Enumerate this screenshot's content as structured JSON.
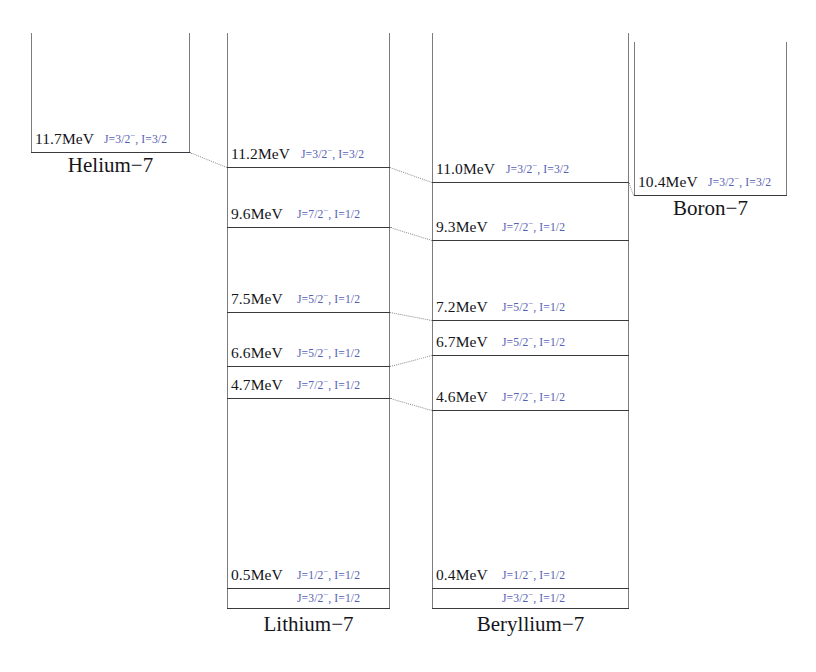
{
  "figure": {
    "type": "nuclear-energy-level-diagram",
    "energy_unit": "MeV"
  },
  "columns": [
    {
      "id": "helium-7",
      "name": "Helium−7",
      "box": {
        "left": 31,
        "right": 190,
        "top": 33,
        "bottom": 152
      },
      "caption_y": 155,
      "levels": [
        {
          "id": "he7-gs",
          "energy": "11.7MeV",
          "qnum": "J=3/2",
          "parity": "−",
          "iso": ", I=3/2",
          "y": 152,
          "label_y": 131,
          "energy_x": 4,
          "qnum_x": 73
        }
      ]
    },
    {
      "id": "lithium-7",
      "name": "Lithium−7",
      "box": {
        "left": 227,
        "right": 390,
        "top": 33,
        "bottom": 608
      },
      "caption_y": 614,
      "levels": [
        {
          "id": "li7-11p2",
          "energy": "11.2MeV",
          "qnum": "J=3/2",
          "parity": "−",
          "iso": ", I=3/2",
          "y": 167,
          "label_y": 146,
          "energy_x": 4,
          "qnum_x": 74
        },
        {
          "id": "li7-9p6",
          "energy": "9.6MeV",
          "qnum": "J=7/2",
          "parity": "−",
          "iso": ", I=1/2",
          "y": 227,
          "label_y": 206,
          "energy_x": 4,
          "qnum_x": 70
        },
        {
          "id": "li7-7p5",
          "energy": "7.5MeV",
          "qnum": "J=5/2",
          "parity": "−",
          "iso": ", I=1/2",
          "y": 312,
          "label_y": 291,
          "energy_x": 4,
          "qnum_x": 70
        },
        {
          "id": "li7-6p6",
          "energy": "6.6MeV",
          "qnum": "J=5/2",
          "parity": "−",
          "iso": ", I=1/2",
          "y": 366,
          "label_y": 345,
          "energy_x": 4,
          "qnum_x": 70
        },
        {
          "id": "li7-4p7",
          "energy": "4.7MeV",
          "qnum": "J=7/2",
          "parity": "−",
          "iso": ", I=1/2",
          "y": 398,
          "label_y": 377,
          "energy_x": 4,
          "qnum_x": 70
        },
        {
          "id": "li7-0p5",
          "energy": "0.5MeV",
          "qnum": "J=1/2",
          "parity": "−",
          "iso": ", I=1/2",
          "y": 588,
          "label_y": 567,
          "energy_x": 4,
          "qnum_x": 70
        },
        {
          "id": "li7-gs",
          "energy": "",
          "qnum": "J=3/2",
          "parity": "−",
          "iso": ", I=1/2",
          "y": 608,
          "label_y": 590,
          "energy_x": 4,
          "qnum_x": 70
        }
      ]
    },
    {
      "id": "beryllium-7",
      "name": "Beryllium−7",
      "box": {
        "left": 432,
        "right": 629,
        "top": 33,
        "bottom": 608
      },
      "caption_y": 614,
      "levels": [
        {
          "id": "be7-11p0",
          "energy": "11.0MeV",
          "qnum": "J=3/2",
          "parity": "−",
          "iso": ", I=3/2",
          "y": 182,
          "label_y": 161,
          "energy_x": 4,
          "qnum_x": 74
        },
        {
          "id": "be7-9p3",
          "energy": "9.3MeV",
          "qnum": "J=7/2",
          "parity": "−",
          "iso": ", I=1/2",
          "y": 240,
          "label_y": 219,
          "energy_x": 4,
          "qnum_x": 70
        },
        {
          "id": "be7-7p2",
          "energy": "7.2MeV",
          "qnum": "J=5/2",
          "parity": "−",
          "iso": ", I=1/2",
          "y": 320,
          "label_y": 299,
          "energy_x": 4,
          "qnum_x": 70
        },
        {
          "id": "be7-6p7",
          "energy": "6.7MeV",
          "qnum": "J=5/2",
          "parity": "−",
          "iso": ", I=1/2",
          "y": 355,
          "label_y": 334,
          "energy_x": 4,
          "qnum_x": 70
        },
        {
          "id": "be7-4p6",
          "energy": "4.6MeV",
          "qnum": "J=7/2",
          "parity": "−",
          "iso": ", I=1/2",
          "y": 410,
          "label_y": 389,
          "energy_x": 4,
          "qnum_x": 70
        },
        {
          "id": "be7-0p4",
          "energy": "0.4MeV",
          "qnum": "J=1/2",
          "parity": "−",
          "iso": ", I=1/2",
          "y": 588,
          "label_y": 567,
          "energy_x": 4,
          "qnum_x": 70
        },
        {
          "id": "be7-gs",
          "energy": "",
          "qnum": "J=3/2",
          "parity": "−",
          "iso": ", I=1/2",
          "y": 608,
          "label_y": 590,
          "energy_x": 4,
          "qnum_x": 70
        }
      ]
    },
    {
      "id": "boron-7",
      "name": "Boron−7",
      "box": {
        "left": 634,
        "right": 787,
        "top": 42,
        "bottom": 195
      },
      "caption_y": 198,
      "levels": [
        {
          "id": "b7-gs",
          "energy": "10.4MeV",
          "qnum": "J=3/2",
          "parity": "−",
          "iso": ", I=3/2",
          "y": 195,
          "label_y": 174,
          "energy_x": 4,
          "qnum_x": 74
        }
      ]
    }
  ],
  "connectors": [
    {
      "id": "conn-he-li",
      "x1": 190,
      "y1": 152,
      "x2": 227,
      "y2": 167
    },
    {
      "id": "conn-li-be-11",
      "x1": 390,
      "y1": 167,
      "x2": 432,
      "y2": 182
    },
    {
      "id": "conn-be-b-11",
      "x1": 629,
      "y1": 182,
      "x2": 634,
      "y2": 195
    },
    {
      "id": "conn-li-be-9",
      "x1": 390,
      "y1": 227,
      "x2": 432,
      "y2": 240
    },
    {
      "id": "conn-li-be-7",
      "x1": 390,
      "y1": 312,
      "x2": 432,
      "y2": 320
    },
    {
      "id": "conn-li-be-6",
      "x1": 390,
      "y1": 366,
      "x2": 432,
      "y2": 355
    },
    {
      "id": "conn-li-be-4",
      "x1": 390,
      "y1": 398,
      "x2": 432,
      "y2": 410
    }
  ]
}
